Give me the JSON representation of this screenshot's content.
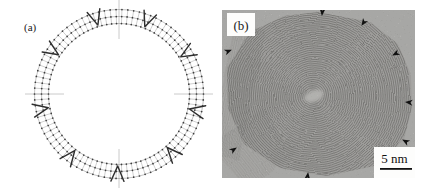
{
  "page": {
    "width": 427,
    "height": 188,
    "background": "#ffffff",
    "kind": "two-panel scientific figure: schematic of polyhedral multishell particle (a) and TEM lattice-fringe micrograph of carbon onion (b)"
  },
  "panel_a": {
    "label": "(a)",
    "kind": "schematic-diagram",
    "subject": "three concentric beaded shells joined by radial rungs, pentagon wedge marks, axis crosshair ticks",
    "center": {
      "x": 119,
      "y": 94
    },
    "shell_radii": [
      70.5,
      77.5,
      84.5
    ],
    "spoke_count": 90,
    "pentagon_angles_deg": [
      -147,
      -107,
      -69,
      -31,
      12,
      48,
      91,
      128,
      169
    ],
    "pentagon_apex_radius": 72,
    "pentagon_arm_radius": 87.5,
    "pentagon_arm_half_angle_deg": 4.3,
    "crosshair_angles_deg": [
      0,
      90,
      180,
      270
    ],
    "crosshair_radii": [
      55,
      94
    ],
    "colors": {
      "dot": "#3d3d3d",
      "spoke": "#a8a8a8",
      "shell": "#909090",
      "crosshair": "#bdbdbd",
      "pentagon_mark": "#2e2e2e",
      "label": "#1a1a1a"
    }
  },
  "panel_b": {
    "label": "(b)",
    "kind": "TEM-micrograph",
    "subject": "polyhedral carbon onion, concentric graphitic lattice fringes, facet vertices marked by arrowheads",
    "frame": {
      "x": 222,
      "y": 10,
      "width": 193,
      "height": 168
    },
    "fringe_center": {
      "x": 92,
      "y": 86
    },
    "fringe_count": 46,
    "fringe_spacing": 2.1,
    "fringe_start_radius": 3,
    "outline": [
      [
        96,
        2
      ],
      [
        148,
        12
      ],
      [
        176,
        34
      ],
      [
        189,
        64
      ],
      [
        190,
        98
      ],
      [
        182,
        130
      ],
      [
        152,
        156
      ],
      [
        104,
        166
      ],
      [
        58,
        158
      ],
      [
        22,
        134
      ],
      [
        6,
        98
      ],
      [
        5,
        58
      ],
      [
        28,
        22
      ],
      [
        62,
        6
      ]
    ],
    "texture_patches": [
      {
        "x": 0,
        "y": 14,
        "width": 30,
        "height": 134,
        "angle": 12,
        "spacing": 2.3,
        "opacity": 0.4
      },
      {
        "x": 2,
        "y": 112,
        "width": 60,
        "height": 56,
        "angle": -38,
        "spacing": 2.4,
        "opacity": 0.35
      }
    ],
    "arrows": [
      {
        "x": 100,
        "y": 5,
        "angle": 95
      },
      {
        "x": 140,
        "y": 15,
        "angle": 123
      },
      {
        "x": 171,
        "y": 45,
        "angle": 154
      },
      {
        "x": 184,
        "y": 92,
        "angle": 186
      },
      {
        "x": 181,
        "y": 130,
        "angle": 209
      },
      {
        "x": 86,
        "y": 163,
        "angle": 277
      },
      {
        "x": 14,
        "y": 138,
        "angle": 326
      },
      {
        "x": 9,
        "y": 40,
        "angle": 338
      }
    ],
    "scale_bar": {
      "label": "5 nm"
    },
    "colors": {
      "background": "#b2b1ad",
      "outside": "#c3c2be",
      "fringe": "#5f5e5a",
      "arrow": "#111111",
      "core_highlight": "#d3d2cd",
      "label": "#111111",
      "scalebar_line": "#111111",
      "label_box": "#fdfdfc"
    }
  }
}
